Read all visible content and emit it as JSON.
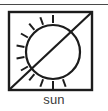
{
  "figure": {
    "name": "sun-symbol-pictogram",
    "caption": "sun",
    "background_color": "#ffffff",
    "stroke_color": "#1c1c1c",
    "rule_color": "#4a4a4a",
    "caption_color": "#3b3b3b"
  },
  "top_rule": {
    "present": true,
    "y": 4,
    "width": 108,
    "thickness": 1
  },
  "frame": {
    "shape": "square",
    "x": 9,
    "y": 12,
    "width": 83,
    "height": 78,
    "stroke_width": 2.4
  },
  "sun": {
    "circle": {
      "cx": 53,
      "cy": 52,
      "r": 27,
      "stroke_width": 2.2
    },
    "ray_count": 11,
    "ray_inner_offset": 2,
    "ray_length": 8,
    "ray_stroke_width": 2,
    "ray_angles_deg": [
      90,
      110,
      130,
      150,
      170,
      190,
      210,
      230,
      250,
      270,
      290
    ]
  },
  "slash": {
    "description": "diagonal line from bottom-left corner to top-right corner of frame",
    "x1": 10,
    "y1": 89,
    "x2": 91,
    "y2": 13,
    "stroke_width": 2.2
  }
}
